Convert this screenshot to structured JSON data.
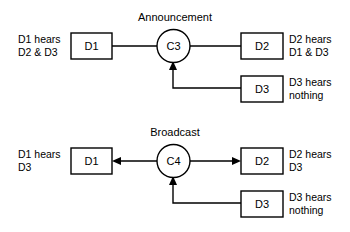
{
  "figure": {
    "type": "diagram",
    "background_color": "#ffffff",
    "stroke_color": "#000000"
  },
  "diagrams": [
    {
      "id": "announcement",
      "title": "Announcement",
      "hub": {
        "id": "C3",
        "label": "C3",
        "shape": "circle"
      },
      "nodes": [
        {
          "id": "D1",
          "label": "D1",
          "shape": "rect",
          "position": "left"
        },
        {
          "id": "D2",
          "label": "D2",
          "shape": "rect",
          "position": "right-top"
        },
        {
          "id": "D3",
          "label": "D3",
          "shape": "rect",
          "position": "right-bottom"
        }
      ],
      "annotations": [
        {
          "for": "D1",
          "line1": "D1 hears",
          "line2": "D2 & D3",
          "side": "left"
        },
        {
          "for": "D2",
          "line1": "D2 hears",
          "line2": "D1 & D3",
          "side": "right"
        },
        {
          "for": "D3",
          "line1": "D3 hears",
          "line2": "nothing",
          "side": "right"
        }
      ],
      "edges": [
        {
          "from": "D1",
          "to": "C3",
          "arrow": "none"
        },
        {
          "from": "C3",
          "to": "D2",
          "arrow": "none"
        },
        {
          "from": "D3",
          "to": "C3",
          "arrow": "to-hub"
        }
      ]
    },
    {
      "id": "broadcast",
      "title": "Broadcast",
      "hub": {
        "id": "C4",
        "label": "C4",
        "shape": "circle"
      },
      "nodes": [
        {
          "id": "D1",
          "label": "D1",
          "shape": "rect",
          "position": "left"
        },
        {
          "id": "D2",
          "label": "D2",
          "shape": "rect",
          "position": "right-top"
        },
        {
          "id": "D3",
          "label": "D3",
          "shape": "rect",
          "position": "right-bottom"
        }
      ],
      "annotations": [
        {
          "for": "D1",
          "line1": "D1 hears",
          "line2": "D3",
          "side": "left"
        },
        {
          "for": "D2",
          "line1": "D2 hears",
          "line2": "D3",
          "side": "right"
        },
        {
          "for": "D3",
          "line1": "D3 hears",
          "line2": "nothing",
          "side": "right"
        }
      ],
      "edges": [
        {
          "from": "C4",
          "to": "D1",
          "arrow": "to-left-node"
        },
        {
          "from": "C4",
          "to": "D2",
          "arrow": "to-right-node"
        },
        {
          "from": "D3",
          "to": "C4",
          "arrow": "to-hub"
        }
      ]
    }
  ]
}
